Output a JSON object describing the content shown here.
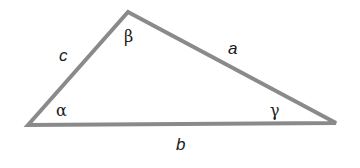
{
  "diagram": {
    "type": "triangle",
    "line_color": "#8a8a8a",
    "vertices": {
      "A": [
        28,
        125
      ],
      "B": [
        128,
        12
      ],
      "C": [
        336,
        123
      ]
    },
    "sides": {
      "a": "a",
      "b": "b",
      "c": "c"
    },
    "angles": {
      "alpha": "α",
      "beta": "β",
      "gamma": "γ"
    }
  }
}
